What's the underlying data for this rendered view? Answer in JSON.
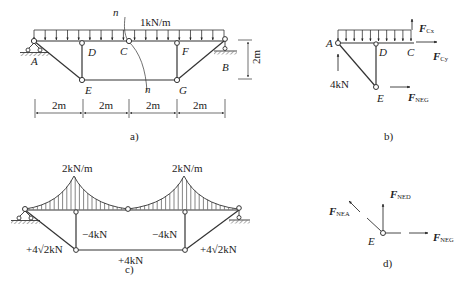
{
  "figure_a": {
    "caption": "a)",
    "load": "1kN/m",
    "section_label_top": "n",
    "section_label_bottom": "n",
    "nodes": {
      "A": "A",
      "B": "B",
      "C": "C",
      "D": "D",
      "E": "E",
      "F": "F",
      "G": "G"
    },
    "height_dim": "2m",
    "spans": [
      "2m",
      "2m",
      "2m",
      "2m"
    ]
  },
  "figure_b": {
    "caption": "b)",
    "nodes": {
      "A": "A",
      "C": "C",
      "D": "D",
      "E": "E"
    },
    "reaction_A": "4kN",
    "forces": {
      "Fcx_main": "F",
      "Fcx_sub": "Cx",
      "Fcy_main": "F",
      "Fcy_sub": "Cy",
      "Fneg_main": "F",
      "Fneg_sub": "NEG"
    }
  },
  "figure_c": {
    "caption": "c)",
    "load_left": "2kN/m",
    "load_right": "2kN/m",
    "member_forces": {
      "DE": "−4kN",
      "FG": "−4kN",
      "AE": "+4√2kN",
      "BG": "+4√2kN",
      "EG": "+4kN"
    }
  },
  "figure_d": {
    "caption": "d)",
    "node": "E",
    "forces": {
      "ned_main": "F",
      "ned_sub": "NED",
      "nea_main": "F",
      "nea_sub": "NEA",
      "neg_main": "F",
      "neg_sub": "NEG"
    }
  }
}
